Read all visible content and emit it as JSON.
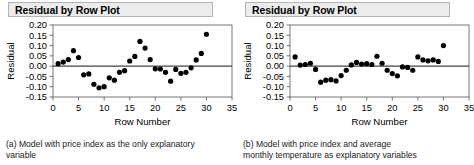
{
  "figure": {
    "panels": [
      {
        "id": "a",
        "title": "Residual by Row Plot",
        "caption": "(a)  Model with price index as the only explanatory variable",
        "caption_line1": "(a)  Model with price index as the only explanatory",
        "caption_line2": "variable",
        "chart_data": {
          "type": "scatter",
          "title": "Residual by Row Plot",
          "xlabel": "Row Number",
          "ylabel": "Residual",
          "xlim": [
            0,
            35
          ],
          "ylim": [
            -0.15,
            0.2
          ],
          "xticks": [
            "0",
            "5",
            "10",
            "15",
            "20",
            "25",
            "30",
            "35"
          ],
          "yticks": [
            "0.20",
            "0.15",
            "0.10",
            "0.05",
            "0.00",
            "-0.05",
            "-0.10",
            "-0.15"
          ],
          "grid": false,
          "legend": "none",
          "zero_reference_line": 0.0,
          "x": [
            1,
            2,
            3,
            4,
            5,
            6,
            7,
            8,
            9,
            10,
            11,
            12,
            13,
            14,
            15,
            16,
            17,
            18,
            19,
            20,
            21,
            22,
            23,
            24,
            25,
            26,
            27,
            28,
            29,
            30
          ],
          "y": [
            0.012,
            0.02,
            0.032,
            0.075,
            0.042,
            -0.042,
            -0.038,
            -0.088,
            -0.105,
            -0.1,
            -0.057,
            -0.068,
            -0.03,
            -0.022,
            0.025,
            0.047,
            0.12,
            0.088,
            0.032,
            -0.013,
            -0.014,
            -0.03,
            -0.073,
            -0.016,
            -0.035,
            -0.03,
            -0.008,
            0.03,
            0.062,
            0.155
          ]
        }
      },
      {
        "id": "b",
        "title": "Residual by Row Plot",
        "caption": "(b)  Model with price index and average monthly temperature  as explanatory variables",
        "caption_line1": "(b)  Model  with  price  index  and  average",
        "caption_line2": "monthly temperature  as explanatory variables",
        "chart_data": {
          "type": "scatter",
          "title": "Residual by Row Plot",
          "xlabel": "Row Number",
          "ylabel": "Residual",
          "xlim": [
            0,
            35
          ],
          "ylim": [
            -0.15,
            0.2
          ],
          "xticks": [
            "0",
            "5",
            "10",
            "15",
            "20",
            "25",
            "30",
            "35"
          ],
          "yticks": [
            "0.20",
            "0.15",
            "0.10",
            "0.05",
            "0.00",
            "-0.05",
            "-0.10",
            "-0.15"
          ],
          "grid": false,
          "legend": "none",
          "zero_reference_line": 0.0,
          "x": [
            1,
            2,
            3,
            4,
            5,
            6,
            7,
            8,
            9,
            10,
            11,
            12,
            13,
            14,
            15,
            16,
            17,
            18,
            19,
            20,
            21,
            22,
            23,
            24,
            25,
            26,
            27,
            28,
            29,
            30
          ],
          "y": [
            0.045,
            0.005,
            0.008,
            0.014,
            -0.016,
            -0.078,
            -0.068,
            -0.066,
            -0.072,
            -0.046,
            -0.02,
            0.006,
            0.018,
            0.01,
            0.012,
            0.008,
            0.048,
            0.014,
            -0.02,
            -0.036,
            -0.047,
            -0.004,
            -0.006,
            -0.02,
            0.045,
            0.03,
            0.026,
            0.03,
            0.023,
            0.1
          ]
        }
      }
    ]
  },
  "colors": {
    "point": "#000000",
    "axis": "#555555",
    "zero_line": "#444444",
    "title_bg": "#ececec",
    "title_border": "#b4b4b4",
    "text": "#000000"
  }
}
